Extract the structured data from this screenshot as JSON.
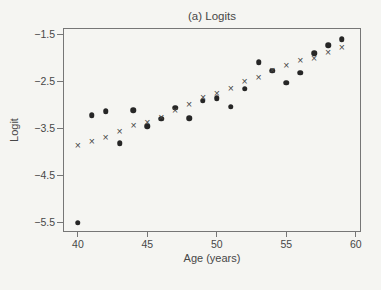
{
  "chart_data": {
    "type": "scatter",
    "title": "(a) Logits",
    "xlabel": "Age (years)",
    "ylabel": "Logit",
    "xlim": [
      39,
      60.3
    ],
    "ylim": [
      -5.69,
      -1.39
    ],
    "grid": false,
    "legend": "none",
    "x_ticks": [
      40,
      45,
      50,
      55,
      60
    ],
    "x_tick_labels": [
      "40",
      "45",
      "50",
      "55",
      "60"
    ],
    "y_ticks": [
      -1.5,
      -2.5,
      -3.5,
      -4.5,
      -5.5
    ],
    "y_tick_labels": [
      "−1.5",
      "−2.5",
      "−3.5",
      "−4.5",
      "−5.5"
    ],
    "x": [
      40,
      41,
      42,
      43,
      44,
      45,
      46,
      47,
      48,
      49,
      50,
      51,
      52,
      53,
      54,
      55,
      56,
      57,
      58,
      59
    ],
    "series": [
      {
        "name": "dots",
        "marker": "filled-circle",
        "color": "#262626",
        "values": [
          -5.51,
          -3.23,
          -3.14,
          -3.82,
          -3.12,
          -3.46,
          -3.3,
          -3.07,
          -3.29,
          -2.92,
          -2.86,
          -3.05,
          -2.66,
          -2.1,
          -2.28,
          -2.53,
          -2.32,
          -1.91,
          -1.74,
          -1.61
        ]
      },
      {
        "name": "crosses",
        "marker": "x-cross",
        "color": "#454545",
        "values": [
          -3.85,
          -3.77,
          -3.68,
          -3.57,
          -3.43,
          -3.37,
          -3.26,
          -3.12,
          -2.99,
          -2.84,
          -2.76,
          -2.64,
          -2.5,
          -2.41,
          -2.26,
          -2.16,
          -2.06,
          -2.0,
          -1.88,
          -1.77
        ]
      }
    ],
    "colors": {
      "background": "#f5f5f2",
      "axis": "#767676",
      "text": "#474747"
    }
  }
}
